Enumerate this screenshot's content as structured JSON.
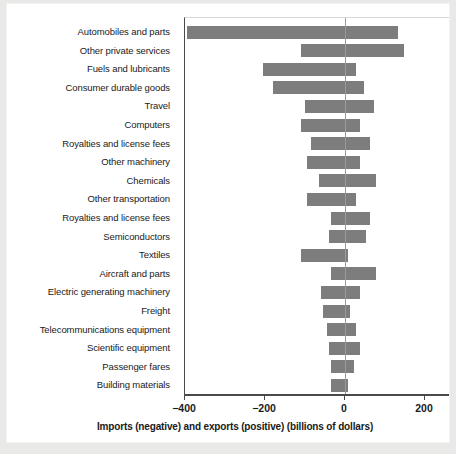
{
  "chart_data": {
    "type": "bar",
    "orientation": "horizontal",
    "title": "",
    "subtitle": "",
    "xlabel": "Imports (negative) and exports (positive) (billions of dollars)",
    "ylabel": "",
    "xlim": [
      -430,
      230
    ],
    "xticks": [
      -400,
      -200,
      0,
      200
    ],
    "xticklabels": [
      "−400",
      "−200",
      "0",
      "200"
    ],
    "grid": false,
    "legend": null,
    "bar_color": "#7d7d7d",
    "zero_line_color": "#9a9a9a",
    "axis_color": "#4a4a4a",
    "categories": [
      "Automobiles and parts",
      "Other private services",
      "Fuels and lubricants",
      "Consumer durable goods",
      "Travel",
      "Computers",
      "Royalties and license fees",
      "Other machinery",
      "Chemicals",
      "Other transportation",
      "Royalties and license fees",
      "Semiconductors",
      "Textiles",
      "Aircraft and parts",
      "Electric generating machinery",
      "Freight",
      "Telecommunications equipment",
      "Scientific equipment",
      "Passenger fares",
      "Building materials"
    ],
    "series": [
      {
        "name": "Imports (negative)",
        "values": [
          -395,
          -110,
          -205,
          -180,
          -100,
          -110,
          -85,
          -95,
          -65,
          -95,
          -35,
          -40,
          -110,
          -35,
          -60,
          -55,
          -45,
          -40,
          -35,
          -35
        ]
      },
      {
        "name": "Exports (positive)",
        "values": [
          130,
          145,
          25,
          45,
          70,
          35,
          60,
          35,
          75,
          25,
          60,
          50,
          5,
          75,
          35,
          10,
          25,
          35,
          20,
          5
        ]
      }
    ],
    "bars": [
      {
        "category": "Automobiles and parts",
        "imports": -395,
        "exports": 130
      },
      {
        "category": "Other private services",
        "imports": -110,
        "exports": 145
      },
      {
        "category": "Fuels and lubricants",
        "imports": -205,
        "exports": 25
      },
      {
        "category": "Consumer durable goods",
        "imports": -180,
        "exports": 45
      },
      {
        "category": "Travel",
        "imports": -100,
        "exports": 70
      },
      {
        "category": "Computers",
        "imports": -110,
        "exports": 35
      },
      {
        "category": "Royalties and license fees",
        "imports": -85,
        "exports": 60
      },
      {
        "category": "Other machinery",
        "imports": -95,
        "exports": 35
      },
      {
        "category": "Chemicals",
        "imports": -65,
        "exports": 75
      },
      {
        "category": "Other transportation",
        "imports": -95,
        "exports": 25
      },
      {
        "category": "Royalties and license fees",
        "imports": -35,
        "exports": 60
      },
      {
        "category": "Semiconductors",
        "imports": -40,
        "exports": 50
      },
      {
        "category": "Textiles",
        "imports": -110,
        "exports": 5
      },
      {
        "category": "Aircraft and parts",
        "imports": -35,
        "exports": 75
      },
      {
        "category": "Electric generating machinery",
        "imports": -60,
        "exports": 35
      },
      {
        "category": "Freight",
        "imports": -55,
        "exports": 10
      },
      {
        "category": "Telecommunications equipment",
        "imports": -45,
        "exports": 25
      },
      {
        "category": "Scientific equipment",
        "imports": -40,
        "exports": 35
      },
      {
        "category": "Passenger fares",
        "imports": -35,
        "exports": 20
      },
      {
        "category": "Building materials",
        "imports": -35,
        "exports": 5
      }
    ]
  }
}
